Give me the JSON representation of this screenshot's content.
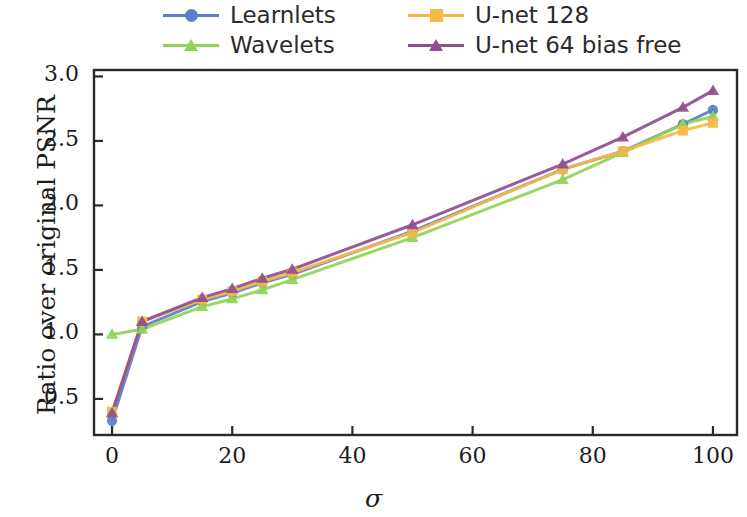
{
  "chart_data": {
    "type": "line",
    "title": "",
    "xlabel": "σ",
    "ylabel": "Ratio over original PSNR",
    "xlim": [
      -3,
      104
    ],
    "ylim": [
      0.22,
      3.05
    ],
    "xticks": [
      0,
      20,
      40,
      60,
      80,
      100
    ],
    "xtick_labels": [
      "0",
      "20",
      "40",
      "60",
      "80",
      "100"
    ],
    "yticks": [
      0.5,
      1.0,
      1.5,
      2.0,
      2.5,
      3.0
    ],
    "ytick_labels": [
      "0.5",
      "1.0",
      "1.5",
      "2.0",
      "2.5",
      "3.0"
    ],
    "grid": false,
    "legend_position": "above-plot",
    "x": [
      0,
      5,
      15,
      20,
      25,
      30,
      50,
      75,
      85,
      95,
      100
    ],
    "series": [
      {
        "name": "Learnlets",
        "color": "#5b7fc7",
        "marker": "circle",
        "values": [
          0.33,
          1.06,
          1.255,
          1.32,
          1.4,
          1.465,
          1.8,
          2.28,
          2.42,
          2.63,
          2.74
        ]
      },
      {
        "name": "Wavelets",
        "color": "#90d457",
        "marker": "triangle",
        "values": [
          1.0,
          1.04,
          1.215,
          1.275,
          1.345,
          1.425,
          1.75,
          2.2,
          2.41,
          2.63,
          2.69
        ]
      },
      {
        "name": "U-net 128",
        "color": "#f6b942",
        "marker": "square",
        "values": [
          0.4,
          1.1,
          1.27,
          1.335,
          1.41,
          1.48,
          1.79,
          2.28,
          2.42,
          2.58,
          2.64
        ]
      },
      {
        "name": "U-net 64 bias free",
        "color": "#8f4e90",
        "marker": "triangle",
        "values": [
          0.39,
          1.1,
          1.285,
          1.355,
          1.435,
          1.505,
          1.85,
          2.32,
          2.53,
          2.76,
          2.89
        ]
      }
    ]
  },
  "legend": {
    "entries": [
      {
        "label": "Learnlets",
        "color": "#5b7fc7",
        "marker": "circle"
      },
      {
        "label": "U-net 128",
        "color": "#f6b942",
        "marker": "square"
      },
      {
        "label": "Wavelets",
        "color": "#90d457",
        "marker": "triangle"
      },
      {
        "label": "U-net 64 bias free",
        "color": "#8f4e90",
        "marker": "triangle"
      }
    ]
  },
  "axes": {
    "y_title": "Ratio over original PSNR",
    "x_title": "σ",
    "y_tick_0": "0.5",
    "y_tick_1": "1.0",
    "y_tick_2": "1.5",
    "y_tick_3": "2.0",
    "y_tick_4": "2.5",
    "y_tick_5": "3.0",
    "x_tick_0": "0",
    "x_tick_1": "20",
    "x_tick_2": "40",
    "x_tick_3": "60",
    "x_tick_4": "80",
    "x_tick_5": "100"
  },
  "colors": {
    "learnlets": "#5b7fc7",
    "wavelets": "#90d457",
    "unet128": "#f6b942",
    "unet64_bias_free": "#8f4e90",
    "frame": "#2a2a2a",
    "text": "#1c1c1c",
    "background": "#ffffff"
  }
}
